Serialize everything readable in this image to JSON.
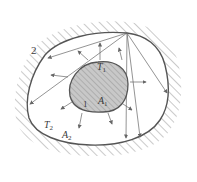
{
  "diagram": {
    "type": "radiation-enclosure",
    "colors": {
      "line": "#555555",
      "inner_fill": "#c8c8c8",
      "hatch": "#8a8a8a",
      "background": "#ffffff"
    },
    "labels": {
      "surface2": "2",
      "body1": "1",
      "T1": "T",
      "T1_sub": "1",
      "A1": "A",
      "A1_sub": "1",
      "T2": "T",
      "T2_sub": "2",
      "A2": "A",
      "A2_sub": "2"
    }
  }
}
